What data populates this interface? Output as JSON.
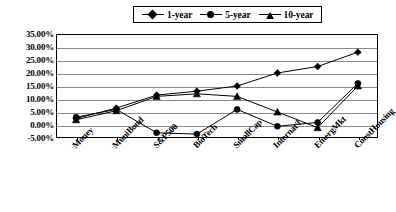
{
  "chart_data": {
    "type": "line",
    "title": "",
    "xlabel": "",
    "ylabel": "",
    "grid": true,
    "legend_position": "top-center",
    "ylim": [
      -5,
      35
    ],
    "ytick_step": 5,
    "ytick_labels": [
      "35.00%",
      "30.00%",
      "25.00%",
      "20.00%",
      "15.00%",
      "10.00%",
      "5.00%",
      "0.00%",
      "-5.00%"
    ],
    "ytick_values": [
      35,
      30,
      25,
      20,
      15,
      10,
      5,
      0,
      -5
    ],
    "categories": [
      "Money",
      "MuniBond",
      "S&P500",
      "BioTech",
      "SmallCap",
      "Internat'l",
      "EmergMkt",
      "ConstHousing"
    ],
    "series": [
      {
        "name": "1-year",
        "marker": "diamond",
        "values": [
          2.5,
          6.5,
          11.5,
          13.0,
          15.0,
          20.0,
          22.5,
          28.0
        ]
      },
      {
        "name": "5-year",
        "marker": "circle",
        "values": [
          3.0,
          6.0,
          -3.0,
          -3.5,
          6.0,
          -0.5,
          1.0,
          16.0
        ]
      },
      {
        "name": "10-year",
        "marker": "triangle",
        "values": [
          2.0,
          5.5,
          11.0,
          12.0,
          11.0,
          5.0,
          -1.0,
          15.0
        ]
      }
    ]
  },
  "legend": {
    "entries": [
      {
        "label": "1-year",
        "marker": "diamond-marker-icon"
      },
      {
        "label": "5-year",
        "marker": "circle-marker-icon"
      },
      {
        "label": "10-year",
        "marker": "triangle-marker-icon"
      }
    ]
  },
  "axis": {
    "y_labels": [
      "35.00%",
      "30.00%",
      "25.00%",
      "20.00%",
      "15.00%",
      "10.00%",
      "5.00%",
      "0.00%",
      "-5.00%"
    ],
    "x_labels": [
      "Money",
      "MuniBond",
      "S&P500",
      "BioTech",
      "SmallCap",
      "Internat'l",
      "EmergMkt",
      "ConstHousing"
    ]
  }
}
